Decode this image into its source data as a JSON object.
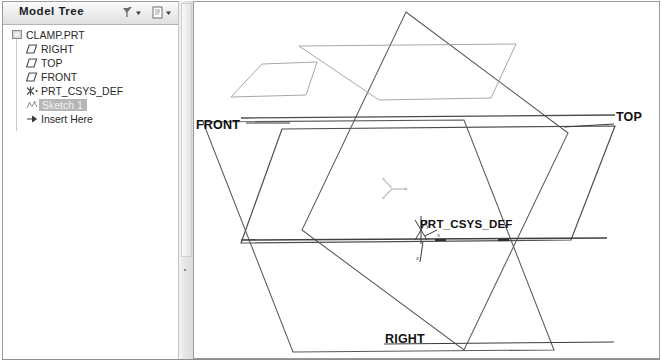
{
  "window": {
    "accent_color": "#b6b6b6",
    "line_color": "#555555",
    "background": "#ffffff"
  },
  "tree_panel": {
    "title": "Model Tree",
    "header_buttons": [
      {
        "name": "filter-settings-icon",
        "label": "Settings"
      },
      {
        "name": "tree-display-icon",
        "label": "Display"
      }
    ],
    "items": [
      {
        "label": "CLAMP.PRT",
        "icon": "part-icon",
        "indent": 0,
        "selected": false
      },
      {
        "label": "RIGHT",
        "icon": "datum-plane-icon",
        "indent": 1,
        "selected": false
      },
      {
        "label": "TOP",
        "icon": "datum-plane-icon",
        "indent": 1,
        "selected": false
      },
      {
        "label": "FRONT",
        "icon": "datum-plane-icon",
        "indent": 1,
        "selected": false
      },
      {
        "label": "PRT_CSYS_DEF",
        "icon": "csys-icon",
        "indent": 1,
        "selected": false
      },
      {
        "label": "Sketch 1",
        "icon": "sketch-icon",
        "indent": 1,
        "selected": true
      },
      {
        "label": "Insert Here",
        "icon": "insert-arrow-icon",
        "indent": 1,
        "selected": false
      }
    ]
  },
  "graphics": {
    "labels": {
      "front": "FRONT",
      "top": "TOP",
      "right": "RIGHT",
      "csys": "PRT_CSYS_DEF"
    },
    "axis_tags": {
      "x": "x",
      "y": "y",
      "z": "z"
    }
  }
}
